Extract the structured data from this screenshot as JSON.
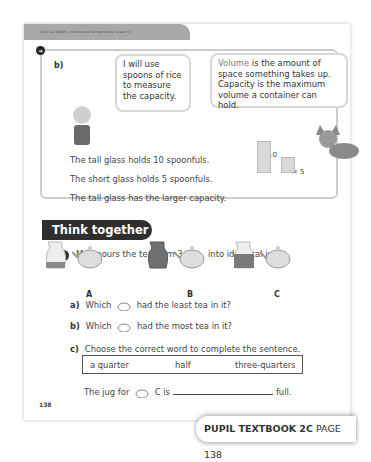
{
  "header": {
    "unit": "Unit 14: Weight, volume and temperature, Lesson 5"
  },
  "panel_b": {
    "label": "b)",
    "bubble_boy": "I will use spoons of rice to measure the capacity.",
    "bubble_fox_highlight": "Volume",
    "bubble_fox_rest": " is the amount of space something takes up. Capacity is the maximum volume a container can hold.",
    "facts": [
      "The tall glass holds 10 spoonfuls.",
      "The short glass holds 5 spoonfuls.",
      "The tall glass has the larger capacity."
    ],
    "tall_label": "× 10",
    "short_label": "× 5"
  },
  "think_together": {
    "title": "Think together",
    "question_number": "1",
    "question_pre": "Meg pours the tea from 3",
    "question_post": "into identical jugs.",
    "figures": [
      {
        "letter": "A",
        "fill_level": 0.25
      },
      {
        "letter": "B",
        "fill_level": 1.0
      },
      {
        "letter": "C",
        "fill_level": 0.6
      }
    ],
    "subs": [
      {
        "label": "a)",
        "pre": "Which",
        "post": "had the least tea in it?"
      },
      {
        "label": "b)",
        "pre": "Which",
        "post": "had the most tea in it?"
      },
      {
        "label": "c)",
        "pre": "Choose the correct word to complete the sentence.",
        "post": ""
      }
    ],
    "word_options": [
      "a quarter",
      "half",
      "three-quarters"
    ],
    "fill_pre": "The jug for",
    "fill_mid": "C is",
    "fill_post": "full."
  },
  "page_number": "138",
  "footer": {
    "book": "PUPIL TEXTBOOK 2C",
    "page": "PAGE 138"
  },
  "colors": {
    "tab_bg": "#2f2f2f",
    "header_bg": "#a8a8a8",
    "tea": "#8a8a8a"
  }
}
